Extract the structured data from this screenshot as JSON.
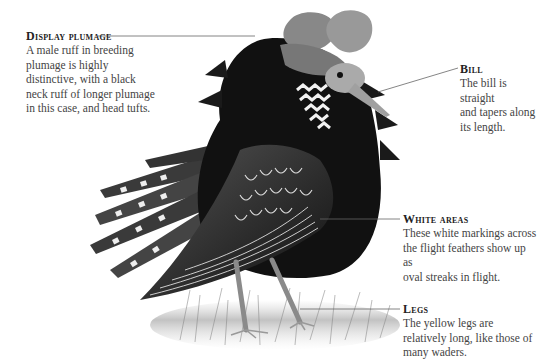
{
  "figure": {
    "subject": "male ruff in breeding plumage",
    "annotations": [
      {
        "id": "display-plumage",
        "title": "Display plumage",
        "text": [
          "A male ruff in breeding",
          "plumage is highly",
          "distinctive, with a black",
          "neck ruff of longer plumage",
          "in this case, and head tufts."
        ]
      },
      {
        "id": "bill",
        "title": "Bill",
        "text": [
          "The bill is straight",
          "and tapers along",
          "its length."
        ]
      },
      {
        "id": "white-areas",
        "title": "White areas",
        "text": [
          "These white markings across",
          "the flight feathers show up as",
          "oval streaks in flight."
        ]
      },
      {
        "id": "legs",
        "title": "Legs",
        "text": [
          "The yellow legs are",
          "relatively long, like those of",
          "many waders."
        ]
      }
    ]
  }
}
